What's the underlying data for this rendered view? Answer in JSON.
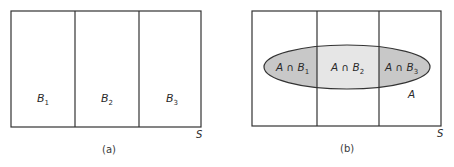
{
  "figure_a": {
    "caption": "(a)",
    "sample_space_label": "S",
    "partitions": [
      {
        "name": "B",
        "sub": "1"
      },
      {
        "name": "B",
        "sub": "2"
      },
      {
        "name": "B",
        "sub": "3"
      }
    ]
  },
  "figure_b": {
    "caption": "(b)",
    "sample_space_label": "S",
    "event_label": "A",
    "intersections": [
      {
        "prefix": "A ∩ B",
        "sub": "1"
      },
      {
        "prefix": "A ∩ B",
        "sub": "2"
      },
      {
        "prefix": "A ∩ B",
        "sub": "3"
      }
    ]
  },
  "colors": {
    "stroke": "#333333",
    "outer_fill": "#c8c8c8",
    "middle_fill": "#e6e6e6"
  }
}
